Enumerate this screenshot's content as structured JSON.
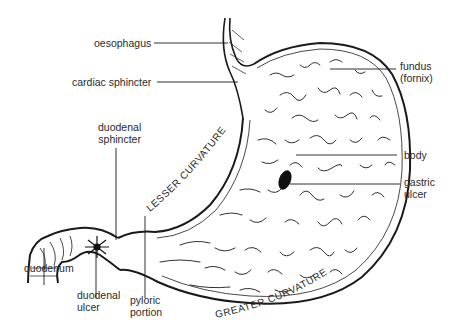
{
  "diagram": {
    "labels": {
      "oesophagus": "oesophagus",
      "cardiac_sphincter": "cardiac sphincter",
      "fundus_line1": "fundus",
      "fundus_line2": "(fornix)",
      "duodenal_sphincter_line1": "duodenal",
      "duodenal_sphincter_line2": "sphincter",
      "body": "body",
      "gastric_ulcer_line1": "gastric",
      "gastric_ulcer_line2": "ulcer",
      "duodenum": "duodenum",
      "duodenal_ulcer_line1": "duodenal",
      "duodenal_ulcer_line2": "ulcer",
      "pyloric_line1": "pyloric",
      "pyloric_line2": "portion",
      "lesser_curvature": "LESSER CURVATURE",
      "greater_curvature": "GREATER CURVATURE"
    },
    "colors": {
      "ink": "#1a1a1a",
      "paper": "#ffffff"
    }
  }
}
